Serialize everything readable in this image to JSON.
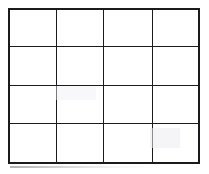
{
  "figure": {
    "kind": "blank-grid",
    "background_color": "#ffffff",
    "line_color": "#1b1b1b",
    "line_width_px": 2,
    "rows": 4,
    "columns": 4,
    "total_cells": 16,
    "grid_bounds_px": {
      "left": 9,
      "top": 9,
      "right": 199,
      "bottom": 163
    },
    "vertical_line_x_px": [
      9,
      57,
      104,
      152,
      199
    ],
    "horizontal_line_y_px": [
      9,
      47,
      86,
      123,
      163
    ],
    "column_widths_px": [
      48,
      47,
      48,
      47
    ],
    "row_heights_px": [
      38,
      39,
      37,
      40
    ]
  },
  "cells": [
    [
      "",
      "",
      "",
      ""
    ],
    [
      "",
      "",
      "",
      ""
    ],
    [
      "",
      "",
      "",
      ""
    ],
    [
      "",
      "",
      "",
      ""
    ]
  ]
}
